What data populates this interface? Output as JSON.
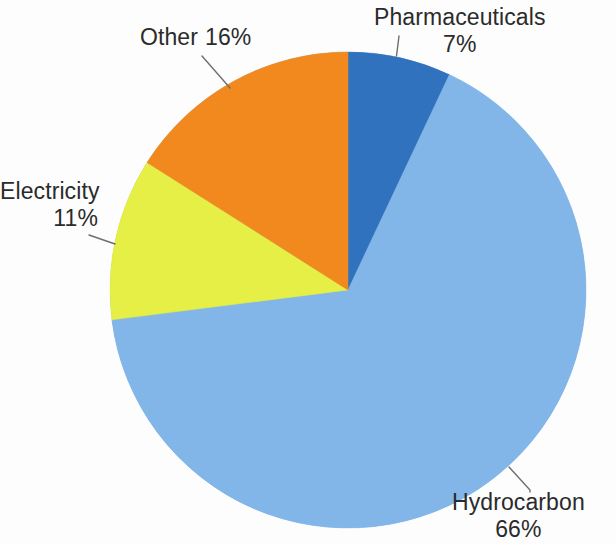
{
  "chart_data": {
    "type": "pie",
    "title": "",
    "subtitle": "",
    "xlabel": "",
    "ylabel": "",
    "legend_position": "none",
    "grid": false,
    "start_angle_deg": 0,
    "direction": "clockwise",
    "units": "percent",
    "total": 100,
    "categories": [
      "Pharmaceuticals",
      "Hydrocarbon",
      "Electricity",
      "Other"
    ],
    "values": [
      7,
      66,
      11,
      16
    ],
    "labels": [
      "7%",
      "66%",
      "11%",
      "16%"
    ],
    "colors": [
      "#3072bd",
      "#82b6e8",
      "#e6ef45",
      "#f2891f"
    ],
    "slices": [
      {
        "name": "Pharmaceuticals",
        "value": 7,
        "label": "7%",
        "color": "#3072bd",
        "start_deg": 0,
        "end_deg": 25.2
      },
      {
        "name": "Hydrocarbon",
        "value": 66,
        "label": "66%",
        "color": "#82b6e8",
        "start_deg": 25.2,
        "end_deg": 262.8
      },
      {
        "name": "Electricity",
        "value": 11,
        "label": "11%",
        "color": "#e6ef45",
        "start_deg": 262.8,
        "end_deg": 302.4
      },
      {
        "name": "Other",
        "value": 16,
        "label": "16%",
        "color": "#f2891f",
        "start_deg": 302.4,
        "end_deg": 360
      }
    ]
  },
  "labels": {
    "pharmaceuticals": {
      "name": "Pharmaceuticals",
      "pct": "7%"
    },
    "hydrocarbon": {
      "name": "Hydrocarbon",
      "pct": "66%"
    },
    "electricity": {
      "name": "Electricity",
      "pct": "11%"
    },
    "other": {
      "name": "Other",
      "pct": "16%"
    }
  },
  "style": {
    "background": "#fdfdfd",
    "text_color": "#2b2b2b",
    "leader_color": "#6e6e6e"
  }
}
